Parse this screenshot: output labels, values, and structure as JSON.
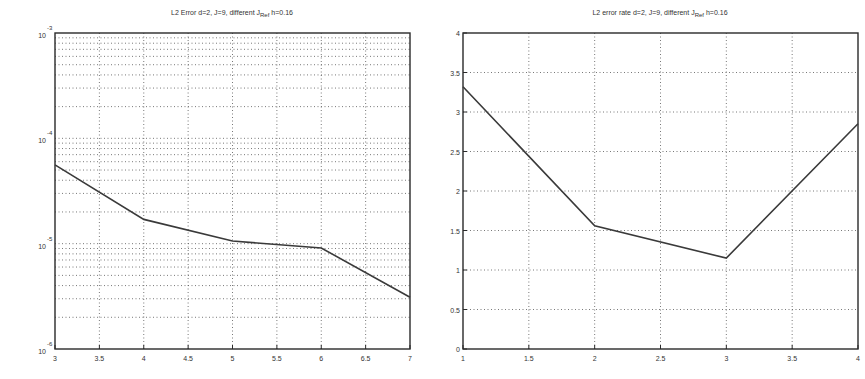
{
  "chart_data": [
    {
      "type": "line",
      "title": "L2 Error d=2, J=9, different J_Ref, h=0.16",
      "title_main": "L2 Error d=2, J=9, different J",
      "title_sub": "Ref",
      "title_tail": "h=0.16",
      "xlabel": "",
      "ylabel": "",
      "yscale": "log",
      "xlim": [
        3,
        7
      ],
      "ylim": [
        1e-06,
        0.001
      ],
      "x_ticks": [
        "3",
        "3.5",
        "4",
        "4.5",
        "5",
        "5.5",
        "6",
        "6.5",
        "7"
      ],
      "y_ticks": [
        {
          "base": "10",
          "exp": "-3"
        },
        {
          "base": "10",
          "exp": "-4"
        },
        {
          "base": "10",
          "exp": "-5"
        },
        {
          "base": "10",
          "exp": "-6"
        }
      ],
      "grid": true,
      "series": [
        {
          "name": "L2 error",
          "x": [
            3,
            4,
            5,
            6,
            7
          ],
          "values": [
            5.6e-05,
            1.7e-05,
            1.06e-05,
            9.1e-06,
            3.1e-06
          ]
        }
      ]
    },
    {
      "type": "line",
      "title": "L2 error rate d=2, J=9, different J_Ref, h=0.16",
      "title_main": "L2 error rate d=2, J=9, different J",
      "title_sub": "Ref",
      "title_tail": "h=0.16",
      "xlabel": "",
      "ylabel": "",
      "yscale": "linear",
      "xlim": [
        1,
        4
      ],
      "ylim": [
        0,
        4
      ],
      "x_ticks": [
        "1",
        "1.5",
        "2",
        "2.5",
        "3",
        "3.5",
        "4"
      ],
      "y_ticks": [
        "0",
        "0.5",
        "1",
        "1.5",
        "2",
        "2.5",
        "3",
        "3.5",
        "4"
      ],
      "grid": true,
      "series": [
        {
          "name": "L2 error rate",
          "x": [
            1,
            2,
            3,
            4
          ],
          "values": [
            3.32,
            1.56,
            1.15,
            2.85
          ]
        }
      ]
    }
  ],
  "colors": {
    "line": "#3a3a3a",
    "frame": "#2a2a2a",
    "grid": "#555555",
    "background": "#ffffff"
  }
}
